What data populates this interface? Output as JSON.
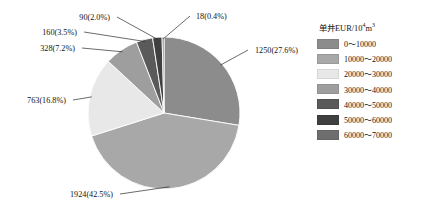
{
  "chart_data": {
    "type": "pie",
    "title": "",
    "legend_title": "单井EUR/10⁴m³",
    "legend_position": "right",
    "total": 4533,
    "categories": [
      "0～10000",
      "10000～20000",
      "20000～30000",
      "30000～40000",
      "40000～50000",
      "50000～60000",
      "60000～70000"
    ],
    "values": [
      1250,
      1924,
      763,
      328,
      160,
      90,
      18
    ],
    "percentages": [
      27.6,
      42.5,
      16.8,
      7.2,
      3.5,
      2.0,
      0.4
    ],
    "data_labels": [
      "1250(27.6%)",
      "1924(42.5%)",
      "763(16.8%)",
      "328(7.2%)",
      "160(3.5%)",
      "90(2.0%)",
      "18(0.4%)"
    ],
    "colors": [
      "#8c8c8c",
      "#a8a8a8",
      "#e8e8e8",
      "#9e9e9e",
      "#5a5a5a",
      "#404040",
      "#6e6e6e"
    ]
  },
  "legend": {
    "title": "单井EUR/10⁴m³",
    "items": [
      {
        "label": "0～10000",
        "color": "#8c8c8c"
      },
      {
        "label": "10000～20000",
        "color": "#a8a8a8"
      },
      {
        "label": "20000～30000",
        "color": "#e8e8e8"
      },
      {
        "label": "30000～40000",
        "color": "#9e9e9e"
      },
      {
        "label": "40000～50000",
        "color": "#5a5a5a"
      },
      {
        "label": "50000～60000",
        "color": "#404040"
      },
      {
        "label": "60000～70000",
        "color": "#6e6e6e"
      }
    ]
  }
}
